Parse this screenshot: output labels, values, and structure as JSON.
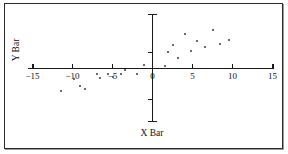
{
  "figure": {
    "background_color": "#ffffff",
    "frame_color": "#2b2b2b",
    "point_color": "#3a3a3a",
    "axis_color": "#1a1a1a"
  },
  "chart_data": {
    "type": "scatter",
    "title": "",
    "xlabel": "X Bar",
    "ylabel": "Y Bar",
    "xlim": [
      -15,
      15
    ],
    "ylim": [
      -7,
      7
    ],
    "grid": false,
    "legend": null,
    "xticks": [
      -15,
      -10,
      -5,
      0,
      5,
      10,
      15
    ],
    "xtick_labels": [
      "−15",
      "−10",
      "−5",
      "0",
      "5",
      "10",
      "15"
    ],
    "yticks": [
      -4,
      2
    ],
    "ytick_labels": [
      "",
      ""
    ],
    "axes_style": "centered-cross",
    "series": [
      {
        "name": "observations",
        "points": [
          [
            -11.5,
            -2.9
          ],
          [
            -9.8,
            -1.3
          ],
          [
            -9.1,
            -2.2
          ],
          [
            -8.4,
            -2.6
          ],
          [
            -7.0,
            -0.7
          ],
          [
            -6.6,
            -1.2
          ],
          [
            -5.6,
            -0.7
          ],
          [
            -5.0,
            -1.1
          ],
          [
            -4.0,
            -0.7
          ],
          [
            -3.4,
            -0.2
          ],
          [
            -2.0,
            -0.7
          ],
          [
            -1.1,
            0.4
          ],
          [
            1.5,
            0.3
          ],
          [
            1.9,
            2.1
          ],
          [
            2.6,
            3.0
          ],
          [
            3.2,
            1.3
          ],
          [
            4.0,
            4.4
          ],
          [
            4.8,
            2.3
          ],
          [
            5.6,
            3.5
          ],
          [
            6.6,
            2.7
          ],
          [
            7.6,
            5.0
          ],
          [
            8.4,
            3.2
          ],
          [
            9.6,
            3.6
          ]
        ]
      }
    ]
  }
}
